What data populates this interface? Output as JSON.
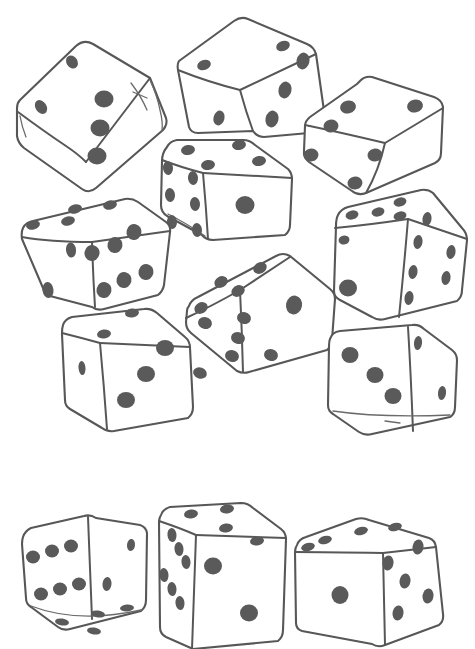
{
  "page": {
    "watermark_text": "",
    "background_color": "#ffffff",
    "outline_color": "#575757",
    "pip_color": "#5a5a5a",
    "width": 475,
    "height": 649
  },
  "illustration": {
    "subject": "dice",
    "style": "hand-drawn black-and-white line art",
    "die_count": 12,
    "total_visible_pips": 41,
    "dice": [
      {
        "id": "die-1",
        "position": "top-left",
        "faces": [
          {
            "name": "top-left-face",
            "pips": 2
          },
          {
            "name": "front-face",
            "pips": 3
          }
        ]
      },
      {
        "id": "die-2",
        "position": "top-center",
        "faces": [
          {
            "name": "top-face",
            "pips": 2
          },
          {
            "name": "left-face",
            "pips": 1
          },
          {
            "name": "right-face",
            "pips": 3
          }
        ]
      },
      {
        "id": "die-3",
        "position": "top-right",
        "faces": [
          {
            "name": "top-face",
            "pips": 2
          },
          {
            "name": "front-face",
            "pips": 3
          }
        ]
      },
      {
        "id": "die-4",
        "position": "upper-center",
        "faces": [
          {
            "name": "top-face",
            "pips": 4
          },
          {
            "name": "left-face",
            "pips": 6
          },
          {
            "name": "front-face",
            "pips": 1
          }
        ]
      },
      {
        "id": "die-5",
        "position": "middle-left",
        "faces": [
          {
            "name": "top-face",
            "pips": 4
          },
          {
            "name": "left-face",
            "pips": 2
          },
          {
            "name": "right-face",
            "pips": 6
          }
        ]
      },
      {
        "id": "die-6",
        "position": "middle-right",
        "faces": [
          {
            "name": "top-face",
            "pips": 5
          },
          {
            "name": "front-face",
            "pips": 1
          },
          {
            "name": "right-face",
            "pips": 6
          }
        ]
      },
      {
        "id": "die-7",
        "position": "center-lower",
        "faces": [
          {
            "name": "top-left-face",
            "pips": 5
          },
          {
            "name": "bottom-left-face",
            "pips": 6
          },
          {
            "name": "right-face",
            "pips": 1
          }
        ]
      },
      {
        "id": "die-8",
        "position": "lower-left",
        "faces": [
          {
            "name": "top-face",
            "pips": 2
          },
          {
            "name": "left-face",
            "pips": 1
          },
          {
            "name": "front-face",
            "pips": 3
          }
        ]
      },
      {
        "id": "die-9",
        "position": "lower-right",
        "faces": [
          {
            "name": "front-face",
            "pips": 3
          },
          {
            "name": "right-face",
            "pips": 2
          }
        ]
      },
      {
        "id": "die-10",
        "position": "bottom-left",
        "faces": [
          {
            "name": "left-face",
            "pips": 6
          },
          {
            "name": "right-face",
            "pips": 2
          },
          {
            "name": "bottom-face",
            "pips": 4
          }
        ]
      },
      {
        "id": "die-11",
        "position": "bottom-center",
        "faces": [
          {
            "name": "top-face",
            "pips": 4
          },
          {
            "name": "left-face",
            "pips": 6
          },
          {
            "name": "front-face",
            "pips": 2
          }
        ]
      },
      {
        "id": "die-12",
        "position": "bottom-right",
        "faces": [
          {
            "name": "top-face",
            "pips": 4
          },
          {
            "name": "left-face",
            "pips": 1
          },
          {
            "name": "right-face",
            "pips": 5
          }
        ]
      }
    ]
  }
}
